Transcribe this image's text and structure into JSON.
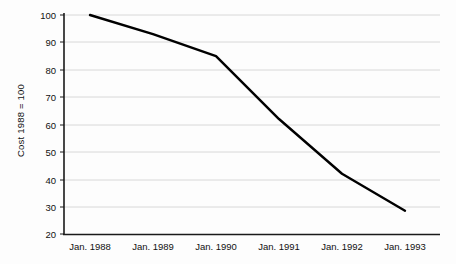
{
  "chart_data": {
    "type": "line",
    "title": "",
    "subtitle": "",
    "xlabel": "",
    "ylabel": "Cost 1988 = 100",
    "categories": [
      "Jan. 1988",
      "Jan. 1989",
      "Jan. 1990",
      "Jan. 1991",
      "Jan. 1992",
      "Jan. 1993"
    ],
    "x": [
      1988,
      1989,
      1990,
      1991,
      1992,
      1993
    ],
    "values": [
      100,
      93,
      85,
      62,
      42,
      28.5
    ],
    "series": [
      {
        "name": "Cost index",
        "values": [
          100,
          93,
          85,
          62,
          42,
          28.5
        ],
        "color": "#000000"
      }
    ],
    "ylim": [
      20,
      100
    ],
    "yticks": [
      20,
      30,
      40,
      50,
      60,
      70,
      80,
      90,
      100
    ],
    "ytick_labels": [
      "20",
      "30",
      "40",
      "50",
      "60",
      "70",
      "80",
      "90",
      "100"
    ],
    "xtick_labels": [
      "Jan. 1988",
      "Jan. 1989",
      "Jan. 1990",
      "Jan. 1991",
      "Jan. 1992",
      "Jan. 1993"
    ],
    "grid": true,
    "grid_color": "#d8d8d8",
    "axis_color": "#1a1a1a",
    "legend": null,
    "legend_position": "none",
    "annotations": []
  },
  "axes": {
    "y_title": "Cost 1988 = 100",
    "y_tick_0": "100",
    "y_tick_1": "90",
    "y_tick_2": "80",
    "y_tick_3": "70",
    "y_tick_4": "60",
    "y_tick_5": "50",
    "y_tick_6": "40",
    "y_tick_7": "30",
    "y_tick_8": "20",
    "x_tick_0": "Jan. 1988",
    "x_tick_1": "Jan. 1989",
    "x_tick_2": "Jan. 1990",
    "x_tick_3": "Jan. 1991",
    "x_tick_4": "Jan. 1992",
    "x_tick_5": "Jan. 1993"
  }
}
